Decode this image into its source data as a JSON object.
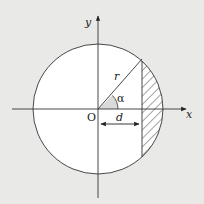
{
  "diagram": {
    "type": "circle-segment",
    "labels": {
      "y_axis": "y",
      "x_axis": "x",
      "origin": "O",
      "radius": "r",
      "angle": "α",
      "distance": "d"
    },
    "colors": {
      "background": "#e9e9e7",
      "circle_fill": "#ffffff",
      "stroke": "#333333",
      "angle_wedge": "#d9d9d9"
    }
  }
}
